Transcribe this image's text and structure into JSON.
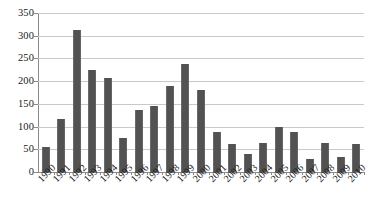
{
  "chart_data": {
    "type": "bar",
    "title": "",
    "subtitle": "",
    "xlabel": "",
    "ylabel": "",
    "categories": [
      "1990",
      "1991",
      "1992",
      "1993",
      "1994",
      "1995",
      "1996",
      "1997",
      "1998",
      "1999",
      "2000",
      "2001",
      "2002",
      "2003",
      "2004",
      "2005",
      "2006",
      "2007",
      "2008",
      "2009",
      "2010"
    ],
    "values": [
      55,
      116,
      313,
      224,
      208,
      75,
      137,
      145,
      190,
      238,
      180,
      87,
      61,
      39,
      64,
      100,
      89,
      28,
      64,
      34,
      61
    ],
    "series": [
      {
        "name": "",
        "values": [
          55,
          116,
          313,
          224,
          208,
          75,
          137,
          145,
          190,
          238,
          180,
          87,
          61,
          39,
          64,
          100,
          89,
          28,
          64,
          34,
          61
        ]
      }
    ],
    "ylim": [
      0,
      350
    ],
    "y_ticks": [
      0,
      50,
      100,
      150,
      200,
      250,
      300,
      350
    ],
    "y_tick_labels": [
      "0",
      "50",
      "100",
      "150",
      "200",
      "250",
      "300",
      "350"
    ],
    "grid": "horizontal",
    "legend": "none",
    "bar_color": "#575757",
    "gridline_color": "#c9c9c9",
    "axis_color": "#8a8a8a",
    "background_color": "#ffffff",
    "x_label_rotation": -45
  }
}
